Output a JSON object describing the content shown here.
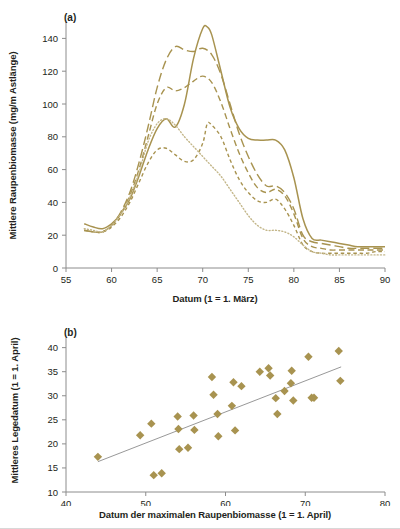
{
  "figure": {
    "background": "#ffffff",
    "accent_color": "#a89350",
    "axis_color": "#8c8c8c",
    "text_color": "#231f20"
  },
  "panel_a": {
    "tag": "(a)",
    "chart_data": {
      "type": "line",
      "title": "",
      "xlabel": "Datum (1 = 1. März)",
      "ylabel": "Mittlere Raupenbiomasse (mg/m Astlänge)",
      "xlim": [
        55,
        90
      ],
      "ylim": [
        0,
        150
      ],
      "xticks": [
        55,
        60,
        65,
        70,
        75,
        80,
        85,
        90
      ],
      "yticks": [
        0,
        20,
        40,
        60,
        80,
        100,
        120,
        140
      ],
      "grid": false,
      "legend": "none",
      "series": [
        {
          "name": "solid",
          "style": "solid",
          "color": "#a89350",
          "x": [
            57,
            58,
            59,
            60,
            61,
            62,
            63,
            64,
            65,
            66,
            67,
            68,
            69,
            70,
            70.5,
            71,
            72,
            73,
            74,
            75,
            76,
            77,
            78,
            79,
            80,
            81,
            82,
            83,
            84,
            85,
            86,
            87,
            88,
            89,
            90
          ],
          "y": [
            27,
            25,
            24,
            27,
            33,
            42,
            56,
            72,
            85,
            91,
            86,
            100,
            128,
            146,
            147,
            142,
            120,
            98,
            85,
            79,
            78,
            78,
            78,
            72,
            55,
            30,
            18,
            17,
            16,
            15,
            14,
            13,
            13,
            13,
            13
          ]
        },
        {
          "name": "long-dash",
          "style": "long-dash",
          "color": "#a89350",
          "x": [
            57,
            58,
            59,
            60,
            61,
            62,
            63,
            64,
            65,
            66,
            67,
            68,
            69,
            70,
            71,
            72,
            73,
            74,
            75,
            76,
            77,
            78,
            79,
            80,
            81,
            82,
            83,
            84,
            85,
            86,
            87,
            88,
            89,
            90
          ],
          "y": [
            23,
            22,
            22,
            26,
            34,
            46,
            64,
            86,
            110,
            127,
            135,
            133,
            132,
            134,
            130,
            118,
            100,
            82,
            68,
            57,
            50,
            50,
            46,
            36,
            20,
            16,
            15,
            14,
            13,
            12,
            12,
            12,
            12,
            12
          ]
        },
        {
          "name": "medium-dash",
          "style": "medium-dash",
          "color": "#a89350",
          "x": [
            57,
            58,
            59,
            60,
            61,
            62,
            63,
            64,
            65,
            66,
            67,
            68,
            69,
            70,
            71,
            72,
            73,
            74,
            75,
            76,
            77,
            78,
            79,
            80,
            81,
            82,
            83,
            84,
            85,
            86,
            87,
            88,
            89,
            90
          ],
          "y": [
            23,
            22,
            22,
            26,
            33,
            44,
            60,
            80,
            100,
            110,
            108,
            110,
            114,
            117,
            113,
            101,
            85,
            70,
            58,
            49,
            46,
            48,
            44,
            33,
            18,
            13,
            12,
            11,
            11,
            11,
            11,
            11,
            11,
            11
          ]
        },
        {
          "name": "short-dash",
          "style": "short-dash",
          "color": "#a89350",
          "x": [
            57,
            58,
            59,
            60,
            61,
            62,
            63,
            64,
            65,
            66,
            67,
            68,
            69,
            70,
            70.5,
            71,
            72,
            73,
            74,
            75,
            76,
            77,
            78,
            79,
            80,
            81,
            82,
            83,
            84,
            85,
            86,
            87,
            88,
            89,
            90
          ],
          "y": [
            23,
            22,
            22,
            25,
            31,
            40,
            52,
            64,
            72,
            73,
            69,
            65,
            66,
            76,
            88,
            87,
            80,
            66,
            54,
            46,
            41,
            40,
            42,
            36,
            26,
            14,
            10,
            9,
            9,
            9,
            9,
            9,
            9,
            10,
            10
          ]
        },
        {
          "name": "dotted",
          "style": "dotted",
          "color": "#c3b689",
          "x": [
            57,
            58,
            59,
            60,
            61,
            62,
            63,
            64,
            65,
            66,
            67,
            68,
            69,
            70,
            71,
            72,
            73,
            74,
            75,
            76,
            77,
            78,
            79,
            80,
            81,
            82,
            83,
            84,
            85,
            86,
            87,
            88,
            89,
            90
          ],
          "y": [
            24,
            23,
            22,
            26,
            33,
            43,
            58,
            77,
            88,
            91,
            87,
            80,
            74,
            68,
            62,
            56,
            48,
            40,
            32,
            26,
            23,
            23,
            22,
            19,
            14,
            10,
            9,
            8,
            8,
            8,
            8,
            8,
            8,
            8
          ]
        }
      ]
    }
  },
  "panel_b": {
    "tag": "(b)",
    "chart_data": {
      "type": "scatter",
      "title": "",
      "xlabel": "Datum der maximalen Raupenbiomasse (1 = 1. April)",
      "ylabel": "Mittleres Legedatum (1 = 1. April)",
      "xlim": [
        40,
        80
      ],
      "ylim": [
        10,
        42
      ],
      "xticks": [
        40,
        50,
        60,
        70,
        80
      ],
      "yticks": [
        10,
        15,
        20,
        25,
        30,
        35,
        40
      ],
      "grid": false,
      "legend": "none",
      "marker": "diamond",
      "marker_color": "#a89350",
      "points": [
        [
          44.0,
          17.3
        ],
        [
          49.3,
          21.8
        ],
        [
          50.7,
          24.2
        ],
        [
          51.0,
          13.5
        ],
        [
          52.0,
          13.9
        ],
        [
          54.0,
          25.7
        ],
        [
          54.1,
          23.1
        ],
        [
          54.2,
          18.9
        ],
        [
          55.3,
          19.2
        ],
        [
          56.0,
          25.9
        ],
        [
          56.1,
          22.9
        ],
        [
          58.3,
          33.9
        ],
        [
          58.5,
          30.2
        ],
        [
          59.0,
          26.2
        ],
        [
          59.1,
          21.6
        ],
        [
          60.8,
          27.9
        ],
        [
          61.0,
          32.8
        ],
        [
          61.2,
          22.8
        ],
        [
          62.0,
          32.0
        ],
        [
          64.3,
          35.0
        ],
        [
          65.4,
          35.7
        ],
        [
          65.6,
          34.2
        ],
        [
          66.3,
          29.5
        ],
        [
          66.5,
          26.2
        ],
        [
          67.4,
          31.0
        ],
        [
          68.2,
          32.6
        ],
        [
          68.3,
          35.2
        ],
        [
          68.5,
          29.0
        ],
        [
          70.4,
          38.1
        ],
        [
          70.8,
          29.6
        ],
        [
          71.1,
          29.6
        ],
        [
          74.2,
          39.3
        ],
        [
          74.4,
          33.1
        ]
      ],
      "trendline": {
        "x": [
          44.0,
          74.5
        ],
        "y": [
          16.3,
          36.0
        ],
        "color": "#8c8c8c"
      }
    }
  }
}
